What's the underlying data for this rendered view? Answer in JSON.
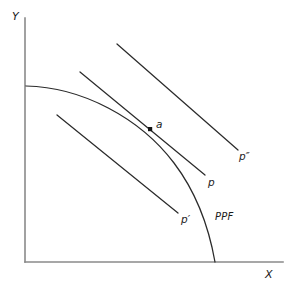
{
  "figure": {
    "type": "economics-ppf-diagram",
    "background_color": "#ffffff",
    "axes": {
      "x_label": "X",
      "y_label": "Y",
      "axis_color": "#8a8a8a",
      "origin": [
        25,
        262
      ],
      "x_axis_end": [
        283,
        262
      ],
      "y_axis_end": [
        25,
        18
      ]
    },
    "curves": {
      "ppf": {
        "label": "PPF",
        "color": "#2b2b2b",
        "start": [
          26,
          86
        ],
        "end": [
          215,
          262
        ]
      }
    },
    "price_lines": [
      {
        "id": "p-prime",
        "label": "p",
        "prime": "′",
        "start": [
          57,
          115
        ],
        "end": [
          178,
          213
        ]
      },
      {
        "id": "p",
        "label": "p",
        "prime": "",
        "start": [
          80,
          72
        ],
        "end": [
          205,
          175
        ]
      },
      {
        "id": "p-double",
        "label": "p",
        "prime": "″",
        "start": [
          117,
          44
        ],
        "end": [
          238,
          150
        ]
      }
    ],
    "points": [
      {
        "id": "tangency-point",
        "label": "a",
        "x": 150,
        "y": 129,
        "color": "#141414"
      }
    ],
    "labels": {
      "y_axis": "Y",
      "x_axis": "X",
      "ppf": "PPF",
      "point_a": "a",
      "p_prime": "p′",
      "p": "p",
      "p_double_prime": "p″"
    }
  }
}
